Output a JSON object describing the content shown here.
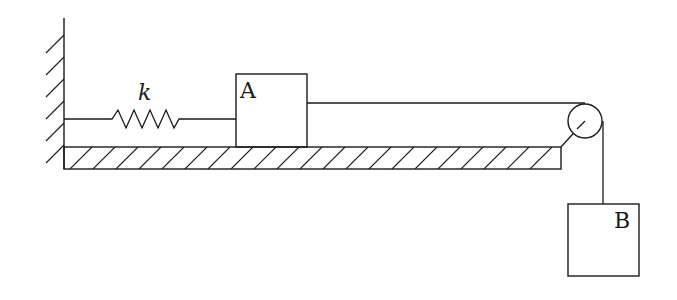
{
  "diagram": {
    "spring_label": "k",
    "block_a_label": "A",
    "block_b_label": "B",
    "line_color": "#1a1a1a",
    "background": "#ffffff"
  }
}
